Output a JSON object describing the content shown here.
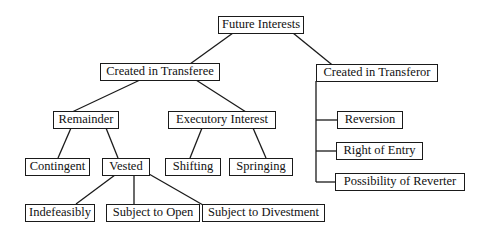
{
  "diagram": {
    "type": "tree",
    "root": {
      "id": "future_interests",
      "label": "Future Interests",
      "children": [
        {
          "id": "created_in_transferee",
          "label": "Created in Transferee",
          "children": [
            {
              "id": "remainder",
              "label": "Remainder",
              "children": [
                {
                  "id": "contingent",
                  "label": "Contingent"
                },
                {
                  "id": "vested",
                  "label": "Vested",
                  "children": [
                    {
                      "id": "indefeasibly",
                      "label": "Indefeasibly"
                    },
                    {
                      "id": "subject_to_open",
                      "label": "Subject to Open"
                    },
                    {
                      "id": "subject_to_divestment",
                      "label": "Subject to Divestment"
                    }
                  ]
                }
              ]
            },
            {
              "id": "executory_interest",
              "label": "Executory Interest",
              "children": [
                {
                  "id": "shifting",
                  "label": "Shifting"
                },
                {
                  "id": "springing",
                  "label": "Springing"
                }
              ]
            }
          ]
        },
        {
          "id": "created_in_transferor",
          "label": "Created in Transferor",
          "children": [
            {
              "id": "reversion",
              "label": "Reversion"
            },
            {
              "id": "right_of_entry",
              "label": "Right of Entry"
            },
            {
              "id": "possibility_of_reverter",
              "label": "Possibility of Reverter"
            }
          ]
        }
      ]
    }
  },
  "nodes": {
    "future_interests": "Future Interests",
    "created_in_transferee": "Created in Transferee",
    "created_in_transferor": "Created in Transferor",
    "remainder": "Remainder",
    "executory_interest": "Executory Interest",
    "contingent": "Contingent",
    "vested": "Vested",
    "shifting": "Shifting",
    "springing": "Springing",
    "indefeasibly": "Indefeasibly",
    "subject_to_open": "Subject to Open",
    "subject_to_divestment": "Subject to Divestment",
    "reversion": "Reversion",
    "right_of_entry": "Right of Entry",
    "possibility_of_reverter": "Possibility of Reverter"
  },
  "colors": {
    "line": "#1a1a1a",
    "box_border": "#1a1a1a",
    "background": "#ffffff",
    "text": "#111111"
  }
}
